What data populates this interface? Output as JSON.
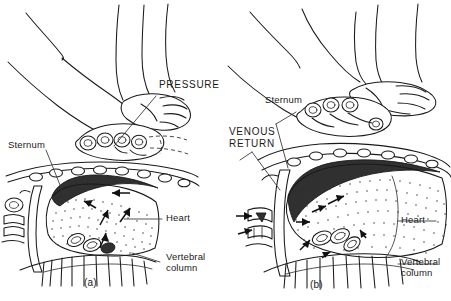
{
  "figure": {
    "background_color": "#ffffff",
    "line_color": "#1a1a1a",
    "shade_color": "#303030",
    "width": 451,
    "height": 301
  },
  "panels": [
    {
      "id": "a",
      "caption": "(a)",
      "phase_label": "PRESSURE",
      "labels": [
        {
          "name": "pressure",
          "text": "PRESSURE",
          "style": "uppercase"
        },
        {
          "name": "sternum",
          "text": "Sternum",
          "style": "mixed"
        },
        {
          "name": "heart",
          "text": "Heart",
          "style": "mixed"
        },
        {
          "name": "vertebral-column",
          "text_line1": "Vertebral",
          "text_line2": "column",
          "style": "mixed"
        }
      ]
    },
    {
      "id": "b",
      "caption": "(b)",
      "phase_label_line1": "VENOUS",
      "phase_label_line2": "RETURN",
      "labels": [
        {
          "name": "venous-return",
          "text_line1": "VENOUS",
          "text_line2": "RETURN",
          "style": "uppercase"
        },
        {
          "name": "sternum",
          "text": "Sternum",
          "style": "mixed"
        },
        {
          "name": "heart",
          "text": "Heart",
          "style": "mixed"
        },
        {
          "name": "vertebral-column",
          "text_line1": "Vertebral",
          "text_line2": "column",
          "style": "mixed"
        }
      ]
    }
  ],
  "labels": {
    "pressure": "PRESSURE",
    "venous_return_line1": "VENOUS",
    "venous_return_line2": "RETURN",
    "sternum_a": "Sternum",
    "sternum_b": "Sternum",
    "heart_a": "Heart",
    "heart_b": "Heart",
    "vertebral_a_line1": "Vertebral",
    "vertebral_a_line2": "column",
    "vertebral_b_line1": "Vertebral",
    "vertebral_b_line2": "column",
    "caption_a": "(a)",
    "caption_b": "(b)"
  }
}
